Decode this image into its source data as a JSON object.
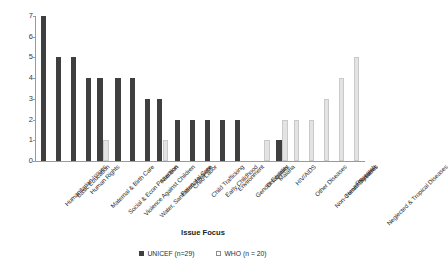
{
  "chart_data": {
    "type": "bar",
    "title": "",
    "xlabel": "Issue Focus",
    "ylabel": "Number of Partnerships",
    "ylim": [
      0,
      7
    ],
    "yticks": [
      0,
      1,
      2,
      3,
      4,
      5,
      6,
      7
    ],
    "grid": false,
    "legend_position": "bottom",
    "categories": [
      "Humanitarian Issues",
      "Basic Education",
      "Human Rights",
      "Maternal & Birth Care",
      "Social & Econ Protection",
      "Violence Against Children",
      "Water, Sanitation, Hygiene",
      "Nutrition",
      "Perenatal Care",
      "Child Labor",
      "Child Trafficking",
      "Early Childhood",
      "Environment",
      "Gender Equality",
      "Disabilities",
      "Malaria",
      "HIV/AIDS",
      "Other Diseases",
      "Non-Comm Diseases",
      "Health Systems",
      "Research",
      "Neglected & Tropical Diseases"
    ],
    "series": [
      {
        "name": "UNICEF (n=29)",
        "color": "#3f3f3f",
        "values": [
          7,
          5,
          5,
          4,
          4,
          4,
          4,
          3,
          3,
          2,
          2,
          2,
          2,
          2,
          0,
          0,
          1,
          0,
          0,
          0,
          0,
          0
        ]
      },
      {
        "name": "WHO (n = 20)",
        "color": "#e3e3e3",
        "values": [
          0,
          0,
          0,
          0,
          1,
          0,
          0,
          0,
          1,
          0,
          0,
          0,
          0,
          0,
          0,
          1,
          2,
          2,
          2,
          3,
          4,
          5
        ]
      }
    ]
  },
  "legend": {
    "items": [
      {
        "label": "UNICEF (n=29)",
        "swatch": "unicef"
      },
      {
        "label": "WHO (n = 20)",
        "swatch": "who"
      }
    ]
  },
  "axes": {
    "y_title": "Number of Partnerships",
    "x_title": "Issue Focus"
  }
}
